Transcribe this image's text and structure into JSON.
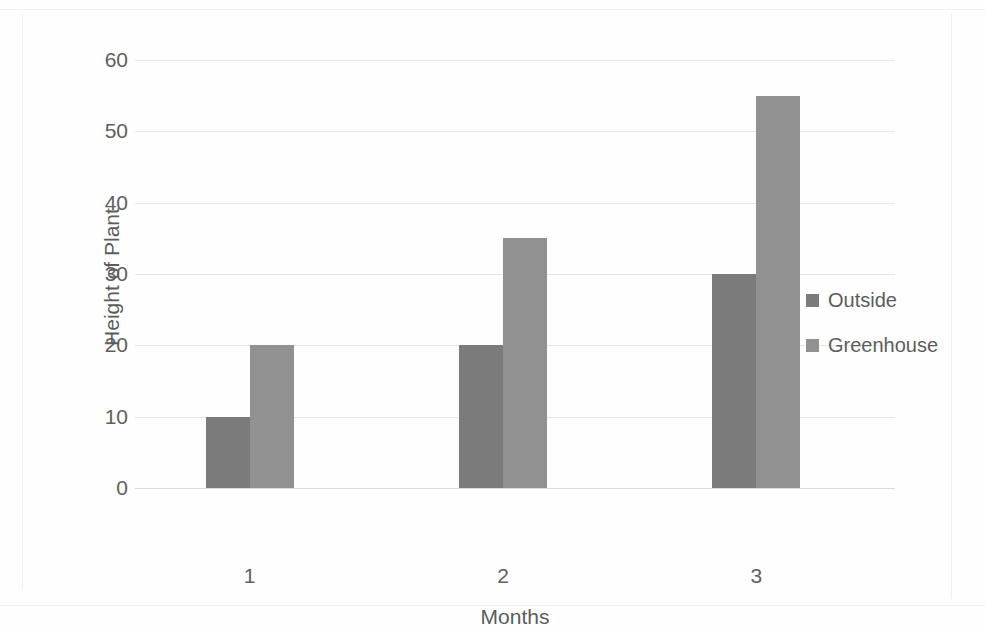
{
  "chart_data": {
    "type": "bar",
    "title": "",
    "subtitle": "",
    "categories": [
      "1",
      "2",
      "3"
    ],
    "series": [
      {
        "name": "Outside",
        "values": [
          10,
          20,
          30
        ],
        "color": "#7b7b7b"
      },
      {
        "name": "Greenhouse",
        "values": [
          20,
          35,
          55
        ],
        "color": "#919191"
      }
    ],
    "xlabel": "Months",
    "ylabel": "Height of Plant",
    "ylim": [
      0,
      60
    ],
    "ytick_step": 10,
    "yticks": [
      "60",
      "50",
      "40",
      "30",
      "20",
      "10",
      "0"
    ],
    "grid": true,
    "grid_axis": "y",
    "legend": true,
    "legend_position": "right",
    "legend_entries": [
      "Outside",
      "Greenhouse"
    ],
    "bar_group_mode": "grouped",
    "background_color": "#ffffff",
    "axis_text_color": "#5c5c5c"
  }
}
